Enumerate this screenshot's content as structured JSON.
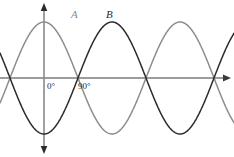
{
  "figure": {
    "width": 234,
    "height": 157,
    "background": "#ffffff"
  },
  "labels": {
    "curve_a": "A",
    "curve_b": "B",
    "origin_angle": "0°",
    "quarter_angle": "90°"
  },
  "axes": {
    "x_axis_name": "horizontal-axis",
    "y_axis_name": "vertical-axis",
    "origin_x": 44,
    "baseline_y": 78,
    "x_start": 0,
    "x_end": 230,
    "y_top": 4,
    "y_bottom": 153,
    "color": "#3a3a3a",
    "arrow_right": true,
    "arrow_up": true,
    "arrow_down": true
  },
  "chart_data": {
    "type": "line",
    "title": "",
    "xlabel": "",
    "ylabel": "",
    "grid": false,
    "legend": "inline-curve-labels",
    "x_unit": "degrees",
    "x": [
      -180,
      -150,
      -120,
      -90,
      -60,
      -30,
      0,
      30,
      60,
      90,
      120,
      150,
      180,
      210,
      240,
      270,
      300,
      330,
      360,
      390,
      420,
      450,
      480
    ],
    "xlim": [
      -117,
      492
    ],
    "ylim": [
      -1,
      1
    ],
    "amplitude": 1,
    "period_degrees": 360,
    "series": [
      {
        "name": "A",
        "color": "#8d8d8d",
        "phase_degrees": 90,
        "formula": "sin(x + 90)",
        "peak_angles": [
          0,
          360
        ],
        "zero_descending_angles": [
          90,
          450
        ],
        "trough_angles": [
          180
        ],
        "values": [
          -1.0,
          -0.87,
          -0.5,
          0.0,
          0.5,
          0.87,
          1.0,
          0.87,
          0.5,
          0.0,
          -0.5,
          -0.87,
          -1.0,
          -0.87,
          -0.5,
          0.0,
          0.5,
          0.87,
          1.0,
          0.87,
          0.5,
          0.0,
          -0.5
        ]
      },
      {
        "name": "B",
        "color": "#2b2b2b",
        "phase_degrees": -90,
        "formula": "sin(x - 90)",
        "trough_angles": [
          0,
          360
        ],
        "zero_ascending_angles": [
          90,
          450
        ],
        "peak_angles": [
          180
        ],
        "values": [
          1.0,
          0.87,
          0.5,
          0.0,
          -0.5,
          -0.87,
          -1.0,
          -0.87,
          -0.5,
          0.0,
          0.5,
          0.87,
          1.0,
          0.87,
          0.5,
          0.0,
          -0.5,
          -0.87,
          -1.0,
          -0.87,
          -0.5,
          0.0,
          0.5
        ]
      }
    ],
    "annotations": [
      {
        "text": "0°",
        "x_degrees": 0,
        "position": "below-axis"
      },
      {
        "text": "90°",
        "x_degrees": 90,
        "position": "below-axis"
      },
      {
        "text": "A",
        "attached_to": "A",
        "position": "above-first-peak"
      },
      {
        "text": "B",
        "attached_to": "B",
        "position": "above-first-peak"
      }
    ],
    "phase_difference_degrees": 180
  }
}
